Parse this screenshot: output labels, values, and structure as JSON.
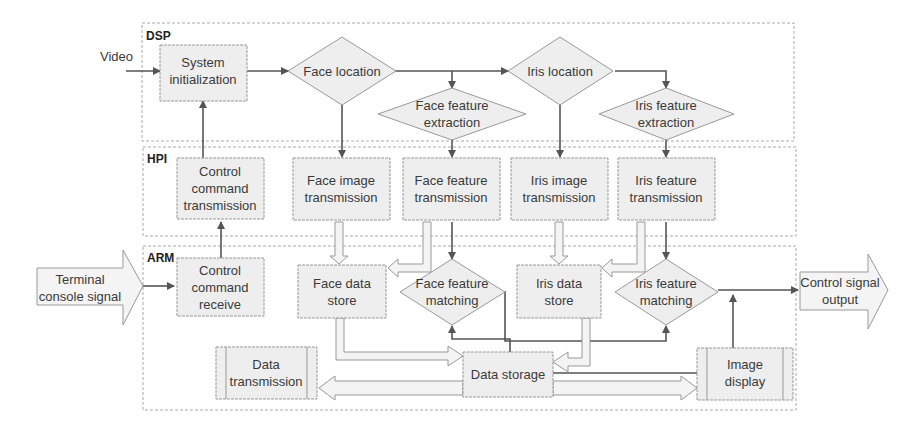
{
  "zones": {
    "dsp": "DSP",
    "hpi": "HPI",
    "arm": "ARM"
  },
  "inputs": {
    "video": "Video",
    "terminal_line1": "Terminal",
    "terminal_line2": "console signal"
  },
  "outputs": {
    "control_line1": "Control signal",
    "control_line2": "output"
  },
  "dsp": {
    "system_init_line1": "System",
    "system_init_line2": "initialization",
    "face_location": "Face location",
    "face_feature_extraction_line1": "Face feature",
    "face_feature_extraction_line2": "extraction",
    "iris_location": "Iris location",
    "iris_feature_extraction_line1": "Iris feature",
    "iris_feature_extraction_line2": "extraction"
  },
  "hpi": {
    "control_cmd_tx_line1": "Control",
    "control_cmd_tx_line2": "command",
    "control_cmd_tx_line3": "transmission",
    "face_image_tx_line1": "Face image",
    "face_image_tx_line2": "transmission",
    "face_feature_tx_line1": "Face feature",
    "face_feature_tx_line2": "transmission",
    "iris_image_tx_line1": "Iris image",
    "iris_image_tx_line2": "transmission",
    "iris_feature_tx_line1": "Iris feature",
    "iris_feature_tx_line2": "transmission"
  },
  "arm": {
    "control_cmd_rx_line1": "Control",
    "control_cmd_rx_line2": "command",
    "control_cmd_rx_line3": "receive",
    "face_data_store_line1": "Face data",
    "face_data_store_line2": "store",
    "face_feature_matching_line1": "Face feature",
    "face_feature_matching_line2": "matching",
    "iris_data_store_line1": "Iris data",
    "iris_data_store_line2": "store",
    "iris_feature_matching_line1": "Iris feature",
    "iris_feature_matching_line2": "matching",
    "data_transmission_line1": "Data",
    "data_transmission_line2": "transmission",
    "data_storage": "Data storage",
    "image_display_line1": "Image",
    "image_display_line2": "display"
  }
}
